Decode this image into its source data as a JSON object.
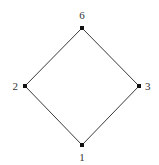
{
  "diagram": {
    "type": "hasse-diagram",
    "nodes": [
      {
        "id": "6",
        "label": "6",
        "x": 82,
        "y": 28,
        "label_x": 82,
        "label_y": 19,
        "anchor": "middle"
      },
      {
        "id": "2",
        "label": "2",
        "x": 25,
        "y": 86,
        "label_x": 18,
        "label_y": 90,
        "anchor": "end"
      },
      {
        "id": "3",
        "label": "3",
        "x": 139,
        "y": 86,
        "label_x": 145,
        "label_y": 90,
        "anchor": "start"
      },
      {
        "id": "1",
        "label": "1",
        "x": 82,
        "y": 145,
        "label_x": 82,
        "label_y": 161,
        "anchor": "middle"
      }
    ],
    "edges": [
      {
        "from": "6",
        "to": "2"
      },
      {
        "from": "6",
        "to": "3"
      },
      {
        "from": "2",
        "to": "1"
      },
      {
        "from": "3",
        "to": "1"
      }
    ],
    "colors": {
      "edge": "#3a3a3a",
      "node": "#111111",
      "label": "#333333",
      "background": "#ffffff"
    }
  }
}
